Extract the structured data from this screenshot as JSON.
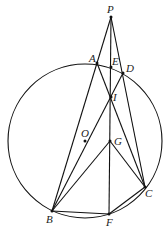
{
  "diagram": {
    "type": "geometry",
    "circle": {
      "name": "O",
      "cx": 85,
      "cy": 141,
      "r": 77
    },
    "points": [
      {
        "name": "P",
        "x": 111,
        "y": 17,
        "lx": 107,
        "ly": 13,
        "dot": true
      },
      {
        "name": "A",
        "x": 97,
        "y": 63,
        "lx": 89,
        "ly": 62,
        "dot": true
      },
      {
        "name": "E",
        "x": 111,
        "y": 67,
        "lx": 112,
        "ly": 65,
        "dot": true
      },
      {
        "name": "D",
        "x": 123,
        "y": 73,
        "lx": 126,
        "ly": 72,
        "dot": true
      },
      {
        "name": "I",
        "x": 111,
        "y": 97,
        "lx": 113,
        "ly": 101,
        "dot": true
      },
      {
        "name": "O",
        "x": 85,
        "y": 141,
        "lx": 81,
        "ly": 137,
        "dot": true
      },
      {
        "name": "G",
        "x": 110,
        "y": 141,
        "lx": 114,
        "ly": 145,
        "dot": true
      },
      {
        "name": "C",
        "x": 145,
        "y": 187,
        "lx": 145,
        "ly": 197,
        "dot": true
      },
      {
        "name": "B",
        "x": 52,
        "y": 211,
        "lx": 46,
        "ly": 223,
        "dot": true
      },
      {
        "name": "F",
        "x": 109,
        "y": 214,
        "lx": 106,
        "ly": 226,
        "dot": true
      }
    ],
    "segments": [
      [
        "P",
        "B"
      ],
      [
        "P",
        "F"
      ],
      [
        "P",
        "C"
      ],
      [
        "A",
        "C"
      ],
      [
        "D",
        "B"
      ],
      [
        "B",
        "G"
      ],
      [
        "G",
        "C"
      ],
      [
        "B",
        "F"
      ],
      [
        "F",
        "C"
      ]
    ]
  }
}
